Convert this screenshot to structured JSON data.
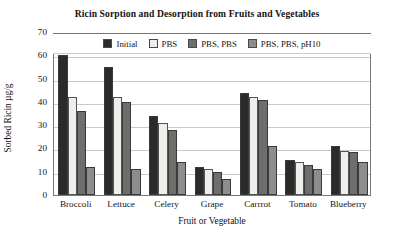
{
  "chart_data": {
    "type": "bar",
    "title": "Ricin Sorption and Desorption from Fruits and Vegetables",
    "xlabel": "Fruit or Vegetable",
    "ylabel": "Sorbed Ricin µg/g",
    "ylim": [
      0,
      70
    ],
    "yticks": [
      0,
      10,
      20,
      30,
      40,
      50,
      60,
      70
    ],
    "grid": "horizontal",
    "legend_position": "top-inside",
    "categories": [
      "Broccoli",
      "Lettuce",
      "Celery",
      "Grape",
      "Carrrot",
      "Tomato",
      "Blueberry"
    ],
    "series": [
      {
        "name": "Initial",
        "color": "#2b2b2b",
        "values": [
          60,
          55,
          34,
          12,
          44,
          15,
          21
        ]
      },
      {
        "name": "PBS",
        "color": "#eeeeea",
        "values": [
          42,
          42,
          31,
          11,
          42,
          14,
          19
        ]
      },
      {
        "name": "PBS, PBS",
        "color": "#6e6e6e",
        "values": [
          36,
          40,
          28,
          10,
          41,
          13,
          18.5
        ]
      },
      {
        "name": "PBS, PBS, pH10",
        "color": "#8d8d8d",
        "values": [
          12,
          11,
          14,
          7,
          21,
          11,
          14
        ]
      }
    ]
  }
}
